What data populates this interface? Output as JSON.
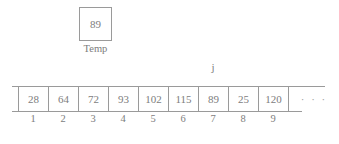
{
  "diagram": {
    "variable": {
      "name": "temp-variable",
      "label": "Temp",
      "value": "89"
    },
    "pointer": {
      "label": "j",
      "target_index": 7
    },
    "array": {
      "cells": [
        {
          "value": "28",
          "index": "1"
        },
        {
          "value": "64",
          "index": "2"
        },
        {
          "value": "72",
          "index": "3"
        },
        {
          "value": "93",
          "index": "4"
        },
        {
          "value": "102",
          "index": "5"
        },
        {
          "value": "115",
          "index": "6"
        },
        {
          "value": "89",
          "index": "7"
        },
        {
          "value": "25",
          "index": "8"
        },
        {
          "value": "120",
          "index": "9"
        }
      ],
      "continuation": "· · ·"
    },
    "colors": {
      "line": "#9a9a9a",
      "text": "#7d7d7d",
      "background": "#ffffff"
    }
  }
}
